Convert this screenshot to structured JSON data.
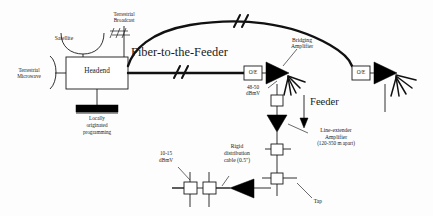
{
  "diagram": {
    "type": "schematic-block-diagram",
    "background_color": "#fdfdfd",
    "line_color": "#1a1a1a",
    "fill_color": "#000000"
  },
  "labels": {
    "satellite": "Satellite",
    "terrestrial_broadcast_l1": "Terrestrial",
    "terrestrial_broadcast_l2": "Broadcast",
    "terrestrial_microwave_l1": "Terrestrial",
    "terrestrial_microwave_l2": "Microwave",
    "headend": "Headend",
    "locally_originated_l1": "Locally",
    "locally_originated_l2": "originated",
    "locally_originated_l3": "programming",
    "fiber_to_the_feeder": "Fiber-to-the-Feeder",
    "oe_left": "O/E",
    "oe_right": "O/E",
    "bridging_amplifier_l1": "Bridging",
    "bridging_amplifier_l2": "Amplifier",
    "level_48_50_l1": "48-50",
    "level_48_50_l2": "dBmV",
    "feeder": "Feeder",
    "line_extender_l1": "Line-extender",
    "line_extender_l2": "Amplifier",
    "line_extender_l3": "(120-350 m apart)",
    "level_10_15_l1": "10-15",
    "level_10_15_l2": "dBmV",
    "rigid_cable_l1": "Rigid",
    "rigid_cable_l2": "distribution",
    "rigid_cable_l3": "cable (0.5\")",
    "tap": "Tap"
  },
  "components": {
    "headend_box": {
      "label": "Headend",
      "shape": "rectangle"
    },
    "oe_converters": [
      {
        "label": "O/E",
        "position": "mid-right"
      },
      {
        "label": "O/E",
        "position": "far-right"
      }
    ],
    "amplifiers": [
      {
        "name": "bridging-amplifier",
        "shape": "filled-triangle-right",
        "count": 2
      },
      {
        "name": "line-extender-amplifier",
        "shape": "filled-triangle-down",
        "spacing": "120-350 m apart"
      },
      {
        "name": "distribution-amplifier",
        "shape": "filled-triangle-left"
      }
    ],
    "taps": {
      "name": "tap",
      "shape": "small-square",
      "count": 9
    },
    "antennas": [
      {
        "name": "satellite-dish",
        "label": "Satellite"
      },
      {
        "name": "yagi-antenna",
        "label": "Terrestrial Broadcast"
      },
      {
        "name": "microwave-horn",
        "label": "Terrestrial Microwave"
      }
    ],
    "signal_levels": [
      {
        "label": "48-50 dBmV",
        "location": "bridging-amplifier-output"
      },
      {
        "label": "10-15 dBmV",
        "location": "tap-output"
      }
    ],
    "cable": {
      "label": "Rigid distribution cable (0.5\")",
      "diameter": "0.5 inch"
    },
    "fiber_break_marks": 2
  }
}
